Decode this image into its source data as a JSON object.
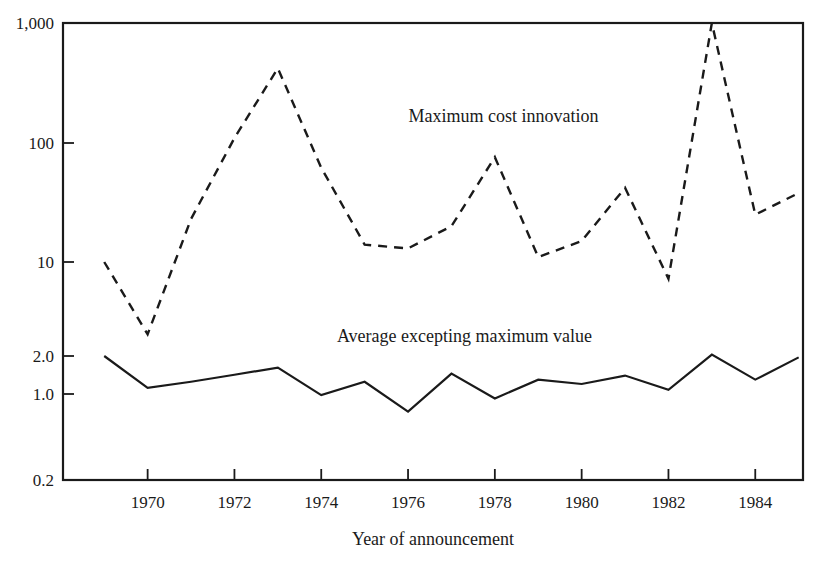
{
  "chart_data": {
    "type": "line",
    "title": "",
    "xlabel": "Year of announcement",
    "ylabel": "",
    "yscale": "log",
    "grid": false,
    "legend_position": "inline-annotation",
    "xlim": [
      1968.05,
      1985.1
    ],
    "ylim": [
      0.2,
      1000
    ],
    "xticks": [
      1970,
      1972,
      1974,
      1976,
      1978,
      1980,
      1982,
      1984
    ],
    "xticklabels": [
      "1970",
      "1972",
      "1974",
      "1976",
      "1978",
      "1980",
      "1982",
      "1984"
    ],
    "yticks": [
      0.2,
      1.0,
      2.0,
      10,
      100,
      1000
    ],
    "yticklabels": [
      "0.2",
      "1.0",
      "2.0",
      "10",
      "100",
      "1,000"
    ],
    "x": [
      1969,
      1970,
      1971,
      1972,
      1973,
      1974,
      1975,
      1976,
      1977,
      1978,
      1979,
      1980,
      1981,
      1982,
      1983,
      1984,
      1985
    ],
    "series": [
      {
        "name": "Maximum cost innovation",
        "style": "dashed",
        "label_x": 1978.2,
        "label_y": 150,
        "values": [
          10,
          2.9,
          23,
          110,
          420,
          62,
          14,
          13,
          20,
          76,
          11,
          15,
          42,
          7.5,
          1000,
          25,
          38
        ]
      },
      {
        "name": "Average excepting maximum value",
        "style": "solid",
        "label_x": 1977.3,
        "label_y": 2.55,
        "values": [
          2.0,
          1.12,
          1.25,
          1.42,
          1.62,
          0.98,
          1.25,
          0.72,
          1.45,
          0.92,
          1.3,
          1.2,
          1.4,
          1.08,
          2.05,
          1.3,
          1.95
        ]
      }
    ],
    "colors": {
      "axis": "#1a1a1a",
      "series_max": "#1a1a1a",
      "series_avg": "#1a1a1a",
      "background": "#ffffff"
    }
  }
}
